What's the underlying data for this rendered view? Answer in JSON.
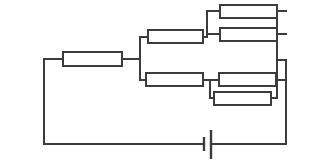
{
  "diagram": {
    "type": "electrical-circuit-schematic",
    "background_color": "#ffffff",
    "line_color": "#3c3c3c",
    "resistor_fill": "#ffffff",
    "line_width": 2,
    "canvas": {
      "width": 313,
      "height": 165
    }
  },
  "components": {
    "resistors": [
      {
        "id": "R1",
        "role": "series-main",
        "label": "",
        "x": 63,
        "y": 52,
        "width": 59,
        "height": 14
      },
      {
        "id": "R2",
        "role": "upper-branch-series",
        "label": "",
        "x": 148,
        "y": 30,
        "width": 55,
        "height": 13
      },
      {
        "id": "R3",
        "role": "upper-parallel-top",
        "label": "",
        "x": 220,
        "y": 5,
        "width": 57,
        "height": 13
      },
      {
        "id": "R4",
        "role": "upper-parallel-bottom",
        "label": "",
        "x": 220,
        "y": 28,
        "width": 57,
        "height": 13
      },
      {
        "id": "R5",
        "role": "lower-branch-series",
        "label": "",
        "x": 146,
        "y": 73,
        "width": 57,
        "height": 13
      },
      {
        "id": "R6",
        "role": "lower-parallel-top",
        "label": "",
        "x": 219,
        "y": 73,
        "width": 57,
        "height": 13
      },
      {
        "id": "R7",
        "role": "lower-parallel-bottom",
        "label": "",
        "x": 214,
        "y": 92,
        "width": 57,
        "height": 13
      }
    ],
    "battery": {
      "id": "B1",
      "label": "",
      "position_x": 207,
      "position_y": 144,
      "short_plate": {
        "x": 204,
        "y_top": 137,
        "y_bottom": 151
      },
      "long_plate": {
        "x": 211,
        "y_top": 130,
        "y_bottom": 159
      }
    }
  },
  "wires": {
    "outer_left_vertical": {
      "x": 44,
      "y_top": 59,
      "y_bottom": 144
    },
    "outer_bottom_left": {
      "y": 144,
      "x_start": 44,
      "x_end": 204
    },
    "outer_bottom_right": {
      "y": 144,
      "x_start": 211,
      "x_end": 286
    },
    "outer_right_vertical": {
      "x": 286,
      "y_top": 60,
      "y_bottom": 144
    },
    "top_lead_left": {
      "y": 59,
      "x_start": 44,
      "x_end": 63
    },
    "series_to_node": {
      "y": 59,
      "x_start": 122,
      "x_end": 140
    },
    "split_node_vertical": {
      "x": 140,
      "y_top": 37,
      "y_bottom": 80
    },
    "upper_branch_in": {
      "y": 37,
      "x_start": 140,
      "x_end": 148
    },
    "upper_mid_link": {
      "y": 37,
      "x_start": 203,
      "x_end": 207
    },
    "upper_mid_vertical": {
      "x": 207,
      "y_top": 11,
      "y_bottom": 34
    },
    "upper_top_in": {
      "y": 11,
      "x_start": 207,
      "x_end": 220
    },
    "upper_bot_in": {
      "y": 34,
      "x_start": 207,
      "x_end": 220
    },
    "upper_top_out": {
      "y": 11,
      "x_start": 277,
      "x_end": 286
    },
    "upper_bot_out": {
      "y": 34,
      "x_start": 277,
      "x_end": 286
    },
    "upper_right_vertical": {
      "x": 277,
      "y_top": 11,
      "y_bottom": 34
    },
    "lower_branch_in": {
      "y": 80,
      "x_start": 140,
      "x_end": 146
    },
    "lower_mid_link": {
      "y": 80,
      "x_start": 203,
      "x_end": 210
    },
    "lower_mid_vertical": {
      "x": 210,
      "y_top": 80,
      "y_bottom": 98
    },
    "lower_top_in": {
      "y": 80,
      "x_start": 210,
      "x_end": 219
    },
    "lower_bot_in": {
      "y": 98,
      "x_start": 210,
      "x_end": 214
    },
    "lower_top_out": {
      "y": 80,
      "x_start": 276,
      "x_end": 286
    },
    "lower_bot_out": {
      "y": 98,
      "x_start": 271,
      "x_end": 286
    }
  }
}
